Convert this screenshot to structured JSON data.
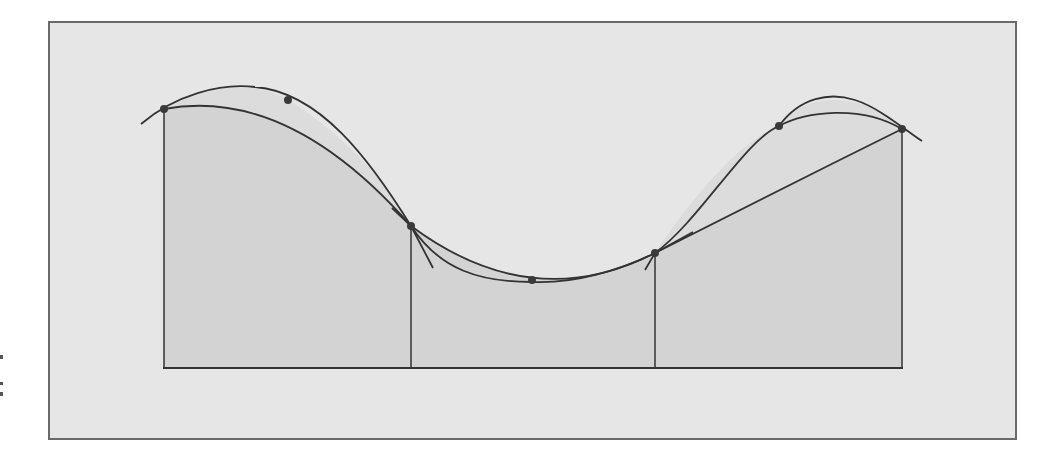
{
  "figure": {
    "colors": {
      "page_bg": "#ffffff",
      "panel_bg": "#e6e6e6",
      "panel_border": "#6a6a6a",
      "area_fill": "#d3d3d3",
      "between_fill": "#dcdcdc",
      "stroke": "#333333",
      "point": "#3a3a3a"
    },
    "panel": {
      "x": 49,
      "y": 22,
      "width": 967,
      "height": 417
    },
    "baseline_y": 368,
    "sample_points": [
      {
        "x": 164,
        "y": 109
      },
      {
        "x": 288,
        "y": 100
      },
      {
        "x": 411,
        "y": 226
      },
      {
        "x": 532,
        "y": 280
      },
      {
        "x": 655,
        "y": 253
      },
      {
        "x": 779,
        "y": 126
      },
      {
        "x": 902,
        "y": 129
      }
    ],
    "strip_boundaries_x": [
      164,
      411,
      655,
      902
    ],
    "panels_count": 3
  }
}
